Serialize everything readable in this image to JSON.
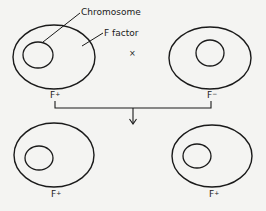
{
  "diagram": {
    "title": "",
    "type": "bacterial conjugation (F+ x F-)",
    "colors": {
      "background": "#f4f4f2",
      "stroke": "#1a1a1a"
    },
    "callouts": {
      "chromosome": "Chromosome",
      "f_factor": "F factor"
    },
    "cross_symbol": "×",
    "arrow_symbol": "↓",
    "parents": [
      {
        "id": "top-left",
        "label": "F",
        "sup": "+"
      },
      {
        "id": "top-right",
        "label": "F",
        "sup": "−"
      }
    ],
    "progeny": [
      {
        "id": "bottom-left",
        "label": "F",
        "sup": "+"
      },
      {
        "id": "bottom-right",
        "label": "F",
        "sup": "+"
      }
    ]
  }
}
